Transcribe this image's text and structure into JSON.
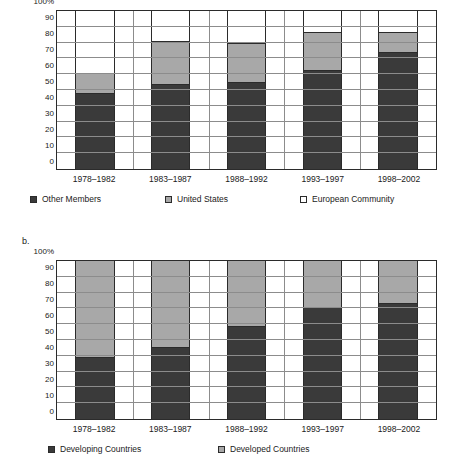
{
  "figure": {
    "panel_a_letter": "",
    "panel_b_letter": "b."
  },
  "chart_data": [
    {
      "type": "bar",
      "subtype": "stacked-100-percent",
      "panel": "a",
      "title": "",
      "xlabel": "",
      "ylabel": "",
      "ylim": [
        0,
        100
      ],
      "yticks": [
        0,
        10,
        20,
        30,
        40,
        50,
        60,
        70,
        80,
        90,
        100
      ],
      "ytick_labels": [
        "0",
        "10",
        "20",
        "30",
        "40",
        "50",
        "60",
        "70",
        "80",
        "90",
        "100%"
      ],
      "grid": true,
      "legend_position": "bottom",
      "categories": [
        "1978–1982",
        "1983–1987",
        "1988–1992",
        "1993–1997",
        "1998–2002"
      ],
      "series": [
        {
          "name": "Other Members",
          "color": "#3a3a3a",
          "values": [
            48,
            54,
            55,
            62.5,
            74
          ]
        },
        {
          "name": "United States",
          "color": "#a8a8a8",
          "values": [
            13,
            27,
            25,
            24,
            13
          ]
        },
        {
          "name": "European Community",
          "color": "#ffffff",
          "values": [
            39,
            19,
            20,
            13.5,
            13
          ]
        }
      ],
      "cumulative_tops": [
        {
          "category": "1978–1982",
          "dark_top": 48,
          "gray_top": 61
        },
        {
          "category": "1983–1987",
          "dark_top": 54,
          "gray_top": 81
        },
        {
          "category": "1988–1992",
          "dark_top": 55,
          "gray_top": 80
        },
        {
          "category": "1993–1997",
          "dark_top": 62.5,
          "gray_top": 86.5
        },
        {
          "category": "1998–2002",
          "dark_top": 74,
          "gray_top": 87
        }
      ]
    },
    {
      "type": "bar",
      "subtype": "stacked-100-percent",
      "panel": "b",
      "title": "",
      "xlabel": "",
      "ylabel": "",
      "ylim": [
        0,
        100
      ],
      "yticks": [
        0,
        10,
        20,
        30,
        40,
        50,
        60,
        70,
        80,
        90,
        100
      ],
      "ytick_labels": [
        "0",
        "10",
        "20",
        "30",
        "40",
        "50",
        "60",
        "70",
        "80",
        "90",
        "100%"
      ],
      "grid": true,
      "legend_position": "bottom",
      "categories": [
        "1978–1982",
        "1983–1987",
        "1988–1992",
        "1993–1997",
        "1998–2002"
      ],
      "series": [
        {
          "name": "Developing Countries",
          "color": "#3a3a3a",
          "values": [
            39.5,
            45.5,
            59,
            71,
            73.5
          ]
        },
        {
          "name": "Developed Countries",
          "color": "#a8a8a8",
          "values": [
            60.5,
            54.5,
            41,
            29,
            26.5
          ]
        }
      ],
      "cumulative_tops": [
        {
          "category": "1978–1982",
          "dark_top": 39.5
        },
        {
          "category": "1983–1987",
          "dark_top": 45.5
        },
        {
          "category": "1988–1992",
          "dark_top": 59
        },
        {
          "category": "1993–1997",
          "dark_top": 71
        },
        {
          "category": "1998–2002",
          "dark_top": 73.5
        }
      ]
    }
  ],
  "colors": {
    "dark": "#3a3a3a",
    "gray": "#a8a8a8",
    "white": "#ffffff",
    "axis": "#2b2b2b",
    "grid": "#8c8c8c"
  }
}
